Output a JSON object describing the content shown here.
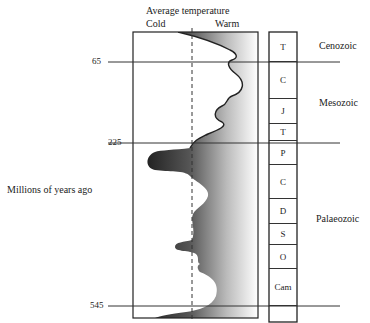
{
  "title": "Average temperature",
  "axis": {
    "cold_label": "Cold",
    "warm_label": "Warm",
    "y_label": "Millions of years ago",
    "ticks": [
      "65",
      "225",
      "545"
    ]
  },
  "eras": [
    {
      "name": "Cenozoic"
    },
    {
      "name": "Mesozoic"
    },
    {
      "name": "Palaeozoic"
    }
  ],
  "periods": [
    {
      "label": "T"
    },
    {
      "label": "C"
    },
    {
      "label": "J"
    },
    {
      "label": "T"
    },
    {
      "label": "P"
    },
    {
      "label": "C"
    },
    {
      "label": "D"
    },
    {
      "label": "S"
    },
    {
      "label": "O"
    },
    {
      "label": "Cam"
    }
  ],
  "colors": {
    "line": "#222222",
    "gradient_dark": "#1a1a1a",
    "gradient_light": "#ffffff"
  }
}
